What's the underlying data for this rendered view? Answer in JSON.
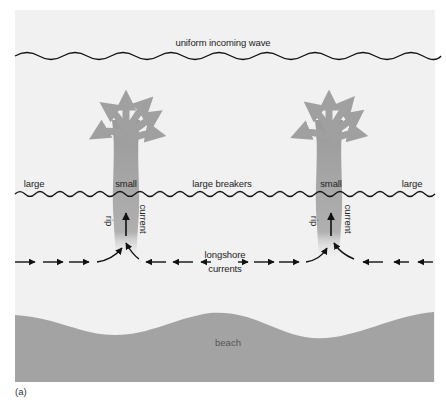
{
  "figure": {
    "caption": "(a)",
    "labels": {
      "incoming_wave": "uniform incoming wave",
      "breakers_left": "large",
      "rip_small_left": "small",
      "breakers_middle": "large breakers",
      "rip_small_right": "small",
      "breakers_right": "large",
      "rip_left": "rip",
      "current_left": "current",
      "rip_right": "rip",
      "current_right": "current",
      "longshore_line1": "longshore",
      "longshore_line2": "currents",
      "beach": "beach"
    },
    "colors": {
      "background": "#f1f1f1",
      "beach": "#a3a3a3",
      "rip_plume": "#9e9e9e",
      "lines": "#111111"
    }
  }
}
